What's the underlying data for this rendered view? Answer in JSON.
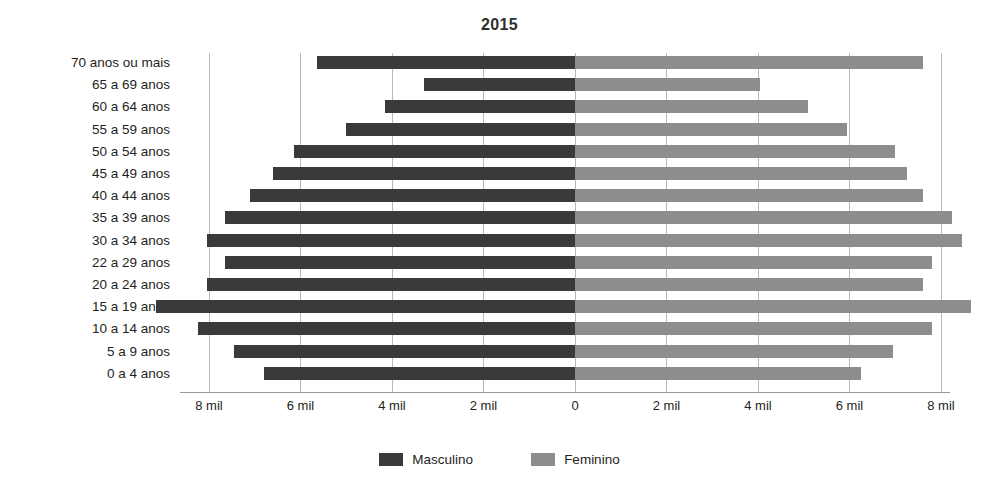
{
  "chart": {
    "title": "2015"
  },
  "legend": {
    "items": [
      {
        "label": "Masculino",
        "color": "#3a3a3a",
        "swatch_name": "legend-swatch-masculino"
      },
      {
        "label": "Feminino",
        "color": "#8d8d8d",
        "swatch_name": "legend-swatch-feminino"
      }
    ]
  },
  "axis": {
    "ticks": [
      {
        "label": "8 mil",
        "value": -8
      },
      {
        "label": "6 mil",
        "value": -6
      },
      {
        "label": "4 mil",
        "value": -4
      },
      {
        "label": "2 mil",
        "value": -2
      },
      {
        "label": "0",
        "value": 0
      },
      {
        "label": "2 mil",
        "value": 2
      },
      {
        "label": "4 mil",
        "value": 4
      },
      {
        "label": "6 mil",
        "value": 6
      },
      {
        "label": "8 mil",
        "value": 8
      }
    ]
  },
  "chart_data": {
    "type": "bar",
    "subtype": "population-pyramid",
    "orientation": "horizontal",
    "title": "2015",
    "subtitle": "",
    "xlabel": "",
    "ylabel": "",
    "xlim": [
      -9.6,
      9.0
    ],
    "grid": true,
    "legend_position": "bottom",
    "units": "mil",
    "categories": [
      "70 anos ou mais",
      "65 a 69 anos",
      "60 a 64 anos",
      "55 a 59 anos",
      "50 a 54 anos",
      "45 a 49 anos",
      "40 a 44 anos",
      "35 a 39 anos",
      "30 a 34 anos",
      "22 a 29 anos",
      "20 a 24 anos",
      "15 a 19 anos",
      "10 a 14 anos",
      "5 a 9 anos",
      "0 a 4 anos"
    ],
    "series": [
      {
        "name": "Masculino",
        "color": "#3a3a3a",
        "direction": "left",
        "values": [
          5.65,
          3.3,
          4.15,
          5.0,
          6.15,
          6.6,
          7.1,
          7.65,
          8.05,
          7.65,
          8.05,
          9.15,
          8.25,
          7.45,
          6.8
        ]
      },
      {
        "name": "Feminino",
        "color": "#8d8d8d",
        "direction": "right",
        "values": [
          7.6,
          4.05,
          5.1,
          5.95,
          7.0,
          7.25,
          7.6,
          8.25,
          8.45,
          7.8,
          7.6,
          8.65,
          7.8,
          6.95,
          6.25
        ]
      }
    ]
  },
  "geometry": {
    "zero_x": 575,
    "px_per_mil": 45.75,
    "row_pitch": 22.2,
    "row_top": 6,
    "bar_height": 13
  }
}
